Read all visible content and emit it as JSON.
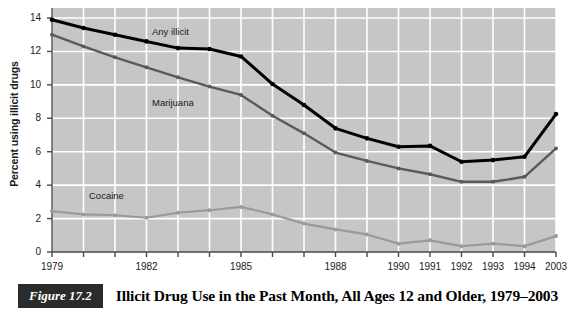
{
  "figure": {
    "number_label": "Figure 17.2",
    "caption": "Illicit Drug Use in the Past Month, All Ages 12 and Older, 1979–2003"
  },
  "colors": {
    "plot_background": "#c6c6c6",
    "gridline": "#ffffff",
    "axis": "#4a4a4a",
    "any_illicit": "#000000",
    "marijuana": "#5a5a5a",
    "cocaine": "#9a9a9a",
    "text": "#1a1a1a",
    "caption_box_bg": "#2b2b2b",
    "caption_box_text": "#ffffff"
  },
  "chart_data": {
    "type": "line",
    "title": "Illicit Drug Use in the Past Month, All Ages 12 and Older, 1979–2003",
    "xlabel": "",
    "ylabel": "Percent using illicit drugs",
    "x": [
      "1979",
      "1980",
      "1981",
      "1982",
      "1983",
      "1984",
      "1985",
      "1986",
      "1987",
      "1988",
      "1989",
      "1990",
      "1991",
      "1992",
      "1993",
      "1994",
      "2003"
    ],
    "x_tick_labels": [
      "1979",
      "",
      "",
      "1982",
      "",
      "",
      "1985",
      "",
      "",
      "1988",
      "",
      "1990",
      "1991",
      "1992",
      "1993",
      "1994",
      "2003"
    ],
    "y_ticks": [
      0,
      2,
      4,
      6,
      8,
      10,
      12,
      14
    ],
    "ylim": [
      0,
      14.6
    ],
    "grid": true,
    "legend": "inline-labels",
    "series": [
      {
        "name": "Any illicit",
        "color": "#000000",
        "values": [
          13.9,
          13.4,
          13.0,
          12.6,
          12.2,
          12.15,
          11.7,
          10.05,
          8.8,
          7.4,
          6.8,
          6.3,
          6.35,
          5.4,
          5.5,
          5.7,
          8.25
        ],
        "label_x": "1983",
        "label_value": 13.1
      },
      {
        "name": "Marijuana",
        "color": "#5a5a5a",
        "values": [
          13.0,
          12.3,
          11.65,
          11.05,
          10.45,
          9.9,
          9.4,
          8.15,
          7.1,
          5.95,
          5.45,
          5.0,
          4.65,
          4.2,
          4.2,
          4.5,
          6.2
        ],
        "label_x": "1983",
        "label_value": 8.85
      },
      {
        "name": "Cocaine",
        "color": "#9a9a9a",
        "values": [
          2.45,
          2.25,
          2.2,
          2.05,
          2.35,
          2.5,
          2.7,
          2.25,
          1.7,
          1.35,
          1.05,
          0.5,
          0.7,
          0.35,
          0.5,
          0.35,
          0.95
        ],
        "label_x": "1981",
        "label_value": 3.3
      }
    ]
  }
}
